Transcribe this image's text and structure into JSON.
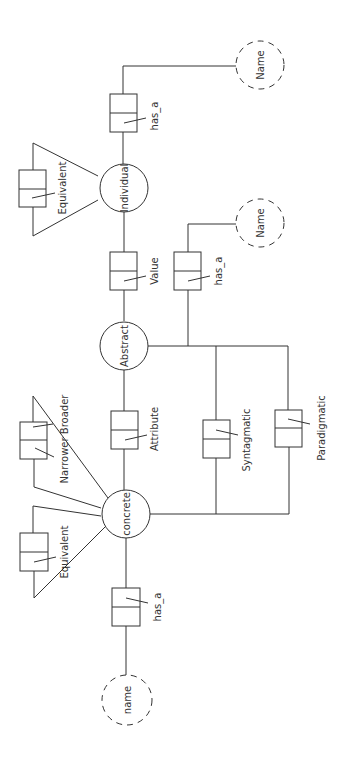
{
  "diagram": {
    "nodes": {
      "individual": "Individual",
      "abstract": "Abstract",
      "concrete": "concrete",
      "name_top": "Name",
      "name_mid": "Name",
      "name_bottom": "name"
    },
    "relations": {
      "has_a_top": "has_a",
      "equivalent_top": "Equivalent",
      "value": "Value",
      "has_a_mid": "has_a",
      "attribute": "Attribute",
      "syntagmatic": "Syntagmatic",
      "paradigmatic": "Paradigmatic",
      "narrower_broader": "Narrower Broader",
      "equivalent_bottom": "Equivalent",
      "has_a_bottom": "has_a"
    }
  }
}
